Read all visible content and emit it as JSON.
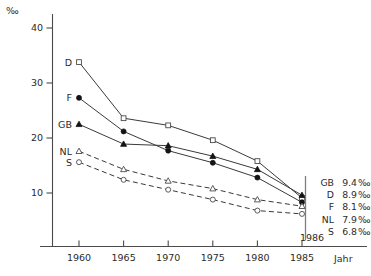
{
  "chart_data": {
    "type": "line",
    "title": "",
    "xlabel": "Jahr",
    "ylabel": "‰",
    "x": [
      1960,
      1965,
      1970,
      1975,
      1980,
      1985
    ],
    "xlim": [
      1957.5,
      1988
    ],
    "ylim": [
      0,
      43
    ],
    "yticks": [
      10,
      20,
      30,
      40
    ],
    "xticks": [
      "1960",
      "1965",
      "1970",
      "1975",
      "1980",
      "1985"
    ],
    "grid": false,
    "legend_position": "right",
    "annotations": [
      "1986"
    ],
    "series": [
      {
        "name": "D",
        "label": "D",
        "marker": "open-square",
        "linestyle": "solid",
        "values": [
          33.8,
          23.6,
          22.3,
          19.6,
          15.8,
          9.1
        ]
      },
      {
        "name": "F",
        "label": "F",
        "marker": "filled-circle",
        "linestyle": "solid",
        "values": [
          27.3,
          21.2,
          17.7,
          15.5,
          12.8,
          8.3
        ]
      },
      {
        "name": "GB",
        "label": "GB",
        "marker": "filled-triangle",
        "linestyle": "solid",
        "values": [
          22.5,
          18.9,
          18.6,
          16.7,
          14.3,
          9.6
        ]
      },
      {
        "name": "NL",
        "label": "NL",
        "marker": "open-triangle",
        "linestyle": "dashed",
        "values": [
          17.6,
          14.3,
          12.2,
          10.8,
          8.8,
          7.6
        ]
      },
      {
        "name": "S",
        "label": "S",
        "marker": "open-circle",
        "linestyle": "dashed",
        "values": [
          15.6,
          12.4,
          10.6,
          8.8,
          6.8,
          6.2
        ]
      }
    ]
  },
  "axis": {
    "unit_symbol": "‰",
    "x_axis_title": "Jahr",
    "y_tick_labels": [
      "40",
      "30",
      "20",
      "10"
    ],
    "x_tick_labels": [
      "1960",
      "1965",
      "1970",
      "1975",
      "1980",
      "1985"
    ],
    "end_year_note": "1986"
  },
  "series_labels": {
    "d": "D",
    "f": "F",
    "gb": "GB",
    "nl": "NL",
    "s": "S"
  },
  "legend": {
    "rows": [
      {
        "code": "GB",
        "value": "9.4",
        "unit": "‰"
      },
      {
        "code": "D",
        "value": "8.9",
        "unit": "‰"
      },
      {
        "code": "F",
        "value": "8.1",
        "unit": "‰"
      },
      {
        "code": "NL",
        "value": "7.9",
        "unit": "‰"
      },
      {
        "code": "S",
        "value": "6.8",
        "unit": "‰"
      }
    ]
  },
  "colors": {
    "axis": "#4a4a4a",
    "line": "#3a3a3a",
    "marker_fill": "#141414",
    "marker_open": "#ffffff",
    "text": "#2b2b2b",
    "background": "#ffffff"
  }
}
